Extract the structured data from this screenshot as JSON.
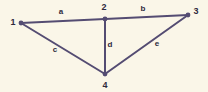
{
  "canvas": {
    "width": 208,
    "height": 92,
    "background_color": "#FAF6E8",
    "stroke_color": "#544C72",
    "text_color": "#2E2A3D"
  },
  "diagram": {
    "type": "undirected-graph",
    "nodes": [
      {
        "id": "1",
        "label": "1",
        "x": 21,
        "y": 23,
        "label_x": 13,
        "label_y": 25
      },
      {
        "id": "2",
        "label": "2",
        "x": 105,
        "y": 19,
        "label_x": 104,
        "label_y": 10
      },
      {
        "id": "3",
        "label": "3",
        "x": 188,
        "y": 15,
        "label_x": 196,
        "label_y": 14
      },
      {
        "id": "4",
        "label": "4",
        "x": 105,
        "y": 74,
        "label_x": 105,
        "label_y": 88
      }
    ],
    "edges": [
      {
        "id": "a",
        "label": "a",
        "from": "1",
        "to": "2",
        "label_x": 61,
        "label_y": 14
      },
      {
        "id": "b",
        "label": "b",
        "from": "2",
        "to": "3",
        "label_x": 143,
        "label_y": 11
      },
      {
        "id": "c",
        "label": "c",
        "from": "1",
        "to": "4",
        "label_x": 55,
        "label_y": 52
      },
      {
        "id": "d",
        "label": "d",
        "from": "2",
        "to": "4",
        "label_x": 110,
        "label_y": 47
      },
      {
        "id": "e",
        "label": "e",
        "from": "4",
        "to": "3",
        "label_x": 157,
        "label_y": 46
      }
    ]
  }
}
